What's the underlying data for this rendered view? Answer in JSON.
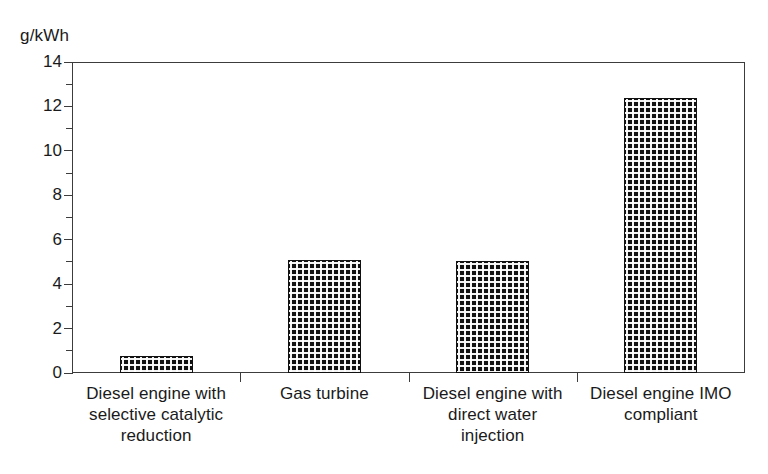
{
  "chart_data": {
    "type": "bar",
    "title": "",
    "subtitle": "",
    "xlabel": "",
    "ylabel": "g/kWh",
    "yunit_caption": "g/kWh",
    "categories": [
      "Diesel engine with selective catalytic reduction",
      "Gas turbine",
      "Diesel engine with direct water injection",
      "Diesel engine IMO compliant"
    ],
    "category_lines": [
      [
        "Diesel engine with",
        "selective catalytic",
        "reduction"
      ],
      [
        "Gas turbine"
      ],
      [
        "Diesel engine with",
        "direct water",
        "injection"
      ],
      [
        "Diesel engine IMO",
        "compliant"
      ]
    ],
    "values": [
      0.75,
      5.1,
      5.05,
      12.4
    ],
    "ylim": [
      0,
      14
    ],
    "ytick_major": [
      0,
      2,
      4,
      6,
      8,
      10,
      12,
      14
    ],
    "ytick_minor": [
      1,
      3,
      5,
      7,
      9,
      11,
      13
    ],
    "ytick_labels": [
      "0",
      "2",
      "4",
      "6",
      "8",
      "10",
      "12",
      "14"
    ],
    "grid": false,
    "legend": false,
    "legend_position": "none",
    "bar_fill": "#111111",
    "bar_pattern": "dense-checkerboard",
    "axis_color": "#3c3c3c",
    "background": "#ffffff"
  }
}
